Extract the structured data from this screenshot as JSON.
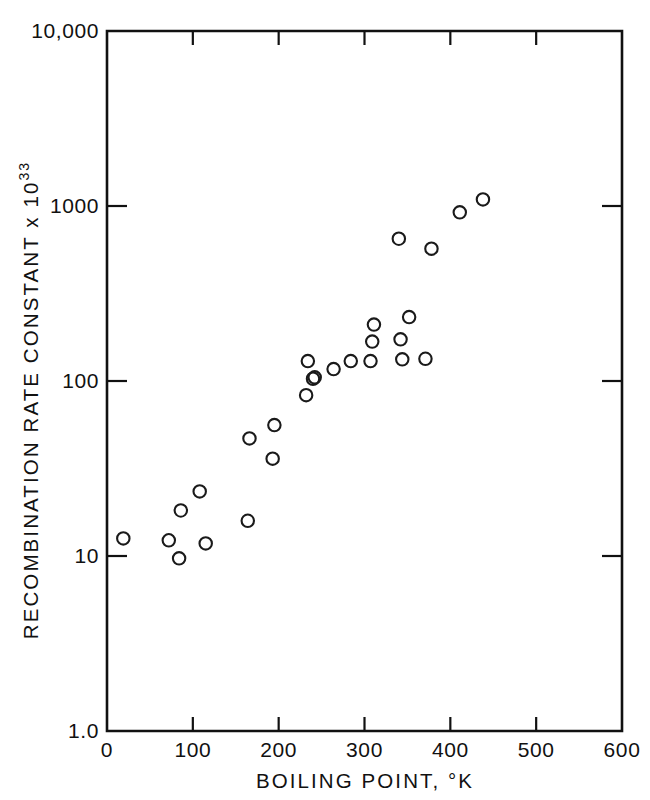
{
  "chart_data": {
    "type": "scatter",
    "title": "",
    "xlabel": "BOILING POINT, °K",
    "ylabel": "RECOMBINATION RATE CONSTANT x 10",
    "ylabel_exponent": "33",
    "xlim": [
      0,
      600
    ],
    "ylim": [
      1.0,
      10000
    ],
    "yscale": "log",
    "xscale": "linear",
    "grid": false,
    "legend": null,
    "marker": "open-circle",
    "xticks": [
      0,
      100,
      200,
      300,
      400,
      500,
      600
    ],
    "xtick_labels": [
      "0",
      "100",
      "200",
      "300",
      "400",
      "500",
      "600"
    ],
    "yticks": [
      1.0,
      10,
      100,
      1000,
      10000
    ],
    "ytick_labels": [
      "1.0",
      "10",
      "100",
      "1000",
      "10,000"
    ],
    "points": [
      {
        "x": 19,
        "y": 12.6
      },
      {
        "x": 72,
        "y": 12.3
      },
      {
        "x": 84,
        "y": 9.7
      },
      {
        "x": 86,
        "y": 18.2
      },
      {
        "x": 108,
        "y": 23.4
      },
      {
        "x": 115,
        "y": 11.8
      },
      {
        "x": 164,
        "y": 15.9
      },
      {
        "x": 166,
        "y": 47.0
      },
      {
        "x": 193,
        "y": 36.0
      },
      {
        "x": 195,
        "y": 56.0
      },
      {
        "x": 232,
        "y": 83.0
      },
      {
        "x": 234,
        "y": 130.0
      },
      {
        "x": 240,
        "y": 103.0
      },
      {
        "x": 242,
        "y": 105.0
      },
      {
        "x": 264,
        "y": 117.0
      },
      {
        "x": 284,
        "y": 130.0
      },
      {
        "x": 307,
        "y": 130.0
      },
      {
        "x": 309,
        "y": 168.0
      },
      {
        "x": 311,
        "y": 210.0
      },
      {
        "x": 340,
        "y": 650.0
      },
      {
        "x": 342,
        "y": 173.0
      },
      {
        "x": 344,
        "y": 133.0
      },
      {
        "x": 352,
        "y": 232.0
      },
      {
        "x": 371,
        "y": 134.0
      },
      {
        "x": 378,
        "y": 570.0
      },
      {
        "x": 411,
        "y": 920.0
      },
      {
        "x": 438,
        "y": 1090.0
      }
    ]
  },
  "axes": {
    "frame_color": "#111111",
    "marker_color": "#1a1a1a",
    "background": "#ffffff"
  }
}
